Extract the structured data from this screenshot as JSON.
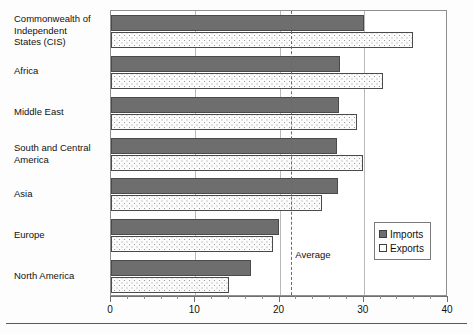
{
  "chart_data": {
    "type": "bar",
    "orientation": "horizontal",
    "title": "",
    "xlabel": "",
    "ylabel": "",
    "xlim": [
      0,
      40
    ],
    "grid": true,
    "gridlines": [
      10,
      20,
      30
    ],
    "legend_position": "bottom-right",
    "categories": [
      "Commonwealth of Independent States (CIS)",
      "Africa",
      "Middle East",
      "South and Central America",
      "Asia",
      "Europe",
      "North America"
    ],
    "category_labels": [
      [
        "Commonwealth of",
        "Independent",
        "States (CIS)"
      ],
      [
        "Africa"
      ],
      [
        "Middle East"
      ],
      [
        "South and Central",
        "America"
      ],
      [
        "Asia"
      ],
      [
        "Europe"
      ],
      [
        "North America"
      ]
    ],
    "series": [
      {
        "name": "Imports",
        "values": [
          30.0,
          27.2,
          27.1,
          26.8,
          27.0,
          19.9,
          16.6
        ]
      },
      {
        "name": "Exports",
        "values": [
          35.8,
          32.3,
          29.2,
          29.9,
          25.0,
          19.2,
          14.0
        ]
      }
    ],
    "tick_labels": [
      "0",
      "10",
      "20",
      "30",
      "40"
    ],
    "tick_values": [
      0,
      10,
      20,
      30,
      40
    ],
    "minor_tick_step": 2,
    "annotations": [
      {
        "label": "Average",
        "value": 21.4,
        "style": "dashed-vertical-line"
      }
    ]
  },
  "legend": {
    "items": [
      {
        "label": "Imports",
        "swatch": "filled-square-icon",
        "color": "#6e6e6e"
      },
      {
        "label": "Exports",
        "swatch": "open-square-icon",
        "color": "#ffffff"
      }
    ]
  },
  "colors": {
    "imports_fill": "#6e6e6e",
    "exports_fill": "#fbfbfb",
    "bar_border": "#4a4a4a",
    "gridline": "#b9b9b9",
    "average_line": "#6a6a6a",
    "frame": "#8f8f8f"
  }
}
